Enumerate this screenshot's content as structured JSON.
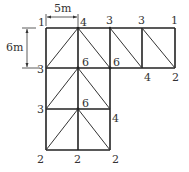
{
  "diagram": {
    "dimensions": {
      "width_label": "5m",
      "height_label": "6m"
    },
    "node_labels": {
      "r0c0": "1",
      "r0c1": "4",
      "r0c2": "3",
      "r0c3": "3",
      "r0c4": "1",
      "r1c0": "3",
      "r1c1": "6",
      "r1c2": "6",
      "r1c3": "4",
      "r1c4": "2",
      "r2c0": "3",
      "r2c1": "6",
      "r2c2": "4",
      "r3c0": "2",
      "r3c1": "2",
      "r3c2": "2"
    },
    "colors": {
      "line": "#222222",
      "text": "#333333"
    }
  }
}
